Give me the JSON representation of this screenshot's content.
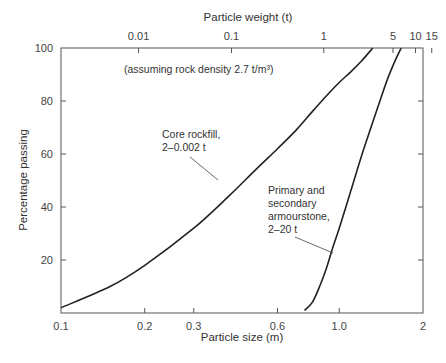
{
  "chart_data": {
    "type": "line",
    "title": "",
    "xlabel": "Particle size (m)",
    "x2label": "Particle weight (t)",
    "ylabel": "Percentage passing",
    "xscale": "log",
    "xlim": [
      0.1,
      2
    ],
    "ylim": [
      0,
      100
    ],
    "grid": false,
    "x_ticks": [
      "0.1",
      "0.2",
      "0.3",
      "0.6",
      "1.0",
      "2"
    ],
    "x_tick_values": [
      0.1,
      0.2,
      0.3,
      0.6,
      1.0,
      2.0
    ],
    "x2_ticks": [
      "0.01",
      "0.1",
      "1",
      "5",
      "10",
      "15"
    ],
    "x2_tick_positions_m": [
      0.19,
      0.41,
      0.88,
      1.56,
      1.88,
      2.15
    ],
    "y_ticks": [
      "20",
      "40",
      "60",
      "80",
      "100"
    ],
    "annotation_note": "(assuming rock density 2.7 t/m³)",
    "series": [
      {
        "name": "Core rockfill, 2–0.002 t",
        "label_line1": "Core rockfill,",
        "label_line2": "2–0.002 t",
        "x": [
          0.1,
          0.15,
          0.2,
          0.3,
          0.4,
          0.5,
          0.6,
          0.7,
          0.8,
          0.9,
          1.0,
          1.1,
          1.2,
          1.32
        ],
        "y": [
          2,
          10,
          18,
          32,
          44,
          54,
          62,
          69,
          76,
          82,
          87,
          91,
          95,
          100
        ]
      },
      {
        "name": "Primary and secondary armourstone, 2–20 t",
        "label_line1": "Primary and",
        "label_line2": "secondary",
        "label_line3": "armourstone,",
        "label_line4": "2–20 t",
        "x": [
          0.75,
          0.8,
          0.85,
          0.9,
          0.95,
          1.0,
          1.1,
          1.2,
          1.3,
          1.4,
          1.5,
          1.6,
          1.67
        ],
        "y": [
          1,
          4,
          10,
          17,
          25,
          32,
          46,
          59,
          70,
          80,
          89,
          96,
          100
        ]
      }
    ]
  }
}
